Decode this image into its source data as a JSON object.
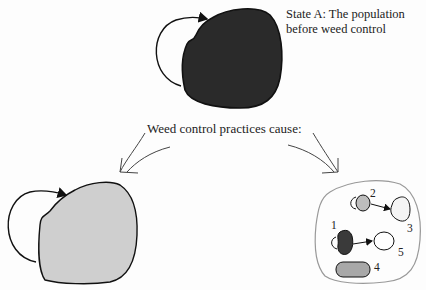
{
  "diagram": {
    "state_a": {
      "label_line1": "State A: The population",
      "label_line2": "before weed control",
      "fill_color": "#2a2a2a"
    },
    "caption": "Weed control practices cause:",
    "left_outcome": {
      "fill_color": "#cfcfcf"
    },
    "right_outcome": {
      "subpopulations": [
        {
          "label": "1",
          "fill_color": "#3a3a3a"
        },
        {
          "label": "2",
          "fill_color": "#bdbdbd"
        },
        {
          "label": "3",
          "fill_color": "#f4f4f4"
        },
        {
          "label": "4",
          "fill_color": "#a8a8a8"
        },
        {
          "label": "5",
          "fill_color": "#ffffff"
        }
      ]
    }
  }
}
